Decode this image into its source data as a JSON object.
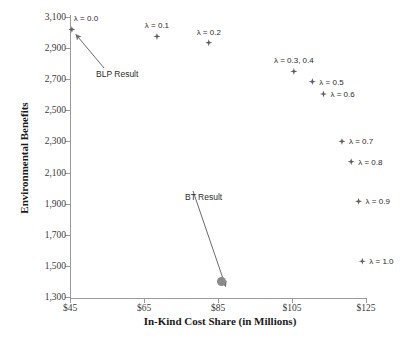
{
  "chart_data": {
    "type": "scatter",
    "title": "",
    "xlabel": "In-Kind Cost Share (in Millions)",
    "ylabel": "Environmental Benefits",
    "xlim": [
      45,
      125
    ],
    "ylim": [
      1300,
      3100
    ],
    "xticks": [
      "$45",
      "$65",
      "$85",
      "$105",
      "$125"
    ],
    "xtick_values": [
      45,
      65,
      85,
      105,
      125
    ],
    "yticks": [
      "3,100",
      "2,900",
      "2,700",
      "2,500",
      "2,300",
      "2,100",
      "1,900",
      "1,700",
      "1,500",
      "1,300"
    ],
    "ytick_values": [
      3100,
      2900,
      2700,
      2500,
      2300,
      2100,
      1900,
      1700,
      1500,
      1300
    ],
    "grid": false,
    "legend": "none",
    "series": [
      {
        "name": "Lambda frontier",
        "marker": "diamond",
        "color": "#5e5e5e",
        "points": [
          {
            "label": "λ = 0.0",
            "x": 45.5,
            "y": 3020,
            "label_pos": "above-right"
          },
          {
            "label": "λ = 0.1",
            "x": 68.5,
            "y": 2975,
            "label_pos": "above"
          },
          {
            "label": "λ = 0.2",
            "x": 82.5,
            "y": 2935,
            "label_pos": "above"
          },
          {
            "label": "λ = 0.3, 0.4",
            "x": 105.5,
            "y": 2750,
            "label_pos": "above"
          },
          {
            "label": "λ = 0.5",
            "x": 110.5,
            "y": 2685,
            "label_pos": "right"
          },
          {
            "label": "λ = 0.6",
            "x": 113.5,
            "y": 2605,
            "label_pos": "right"
          },
          {
            "label": "λ = 0.7",
            "x": 118.5,
            "y": 2300,
            "label_pos": "right"
          },
          {
            "label": "λ = 0.8",
            "x": 121.0,
            "y": 2170,
            "label_pos": "right"
          },
          {
            "label": "λ = 0.9",
            "x": 123.0,
            "y": 1915,
            "label_pos": "right"
          },
          {
            "label": "λ = 1.0",
            "x": 124.0,
            "y": 1530,
            "label_pos": "right"
          }
        ]
      },
      {
        "name": "BT Result",
        "marker": "circle",
        "color": "#8a8a8a",
        "points": [
          {
            "label": "",
            "x": 86.0,
            "y": 1400,
            "label_pos": "none"
          }
        ]
      }
    ],
    "annotations": [
      {
        "text": "BLP Result",
        "target_x": 45.5,
        "target_y": 3020,
        "text_x": 96,
        "text_y": 69
      },
      {
        "text": "BT Result",
        "target_x": 86.0,
        "target_y": 1400,
        "text_x": 185,
        "text_y": 192
      }
    ]
  }
}
